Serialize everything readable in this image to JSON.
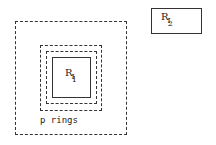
{
  "diagram": {
    "region_2": {
      "label": "R",
      "sub1": "I",
      "sub2": "2"
    },
    "region_1": {
      "label": "R",
      "sub1": "I",
      "sub2": "1"
    },
    "rings_label": "p rings",
    "stroke_color": "#333333"
  }
}
